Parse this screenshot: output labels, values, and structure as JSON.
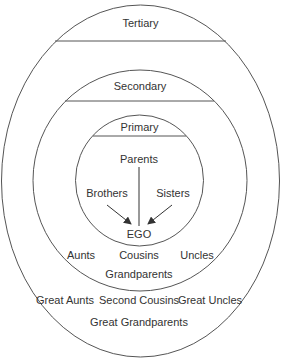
{
  "diagram": {
    "zones": {
      "tertiary": {
        "label": "Tertiary"
      },
      "secondary": {
        "label": "Secondary"
      },
      "primary": {
        "label": "Primary"
      }
    },
    "primary_members": {
      "parents": "Parents",
      "brothers": "Brothers",
      "sisters": "Sisters",
      "ego": "EGO"
    },
    "secondary_members": {
      "aunts": "Aunts",
      "cousins": "Cousins",
      "uncles": "Uncles",
      "grandparents": "Grandparents"
    },
    "tertiary_members": {
      "great_aunts": "Great Aunts",
      "second_cousins": "Second Cousins",
      "great_uncles": "Great Uncles",
      "great_grandparents": "Great Grandparents"
    },
    "colors": {
      "stroke": "#555555",
      "text": "#333333",
      "background": "#ffffff"
    }
  }
}
